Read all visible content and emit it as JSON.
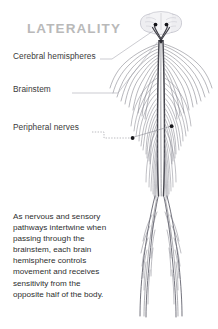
{
  "title": "LATERALITY",
  "colors": {
    "title": "#b9b9b9",
    "label_text": "#3a3a3a",
    "body_text": "#2e2e2e",
    "background": "#ffffff",
    "nerve_line": "#6e6e78",
    "spinal_cord": "#4a4a52",
    "leader_line": "#9a9aa2",
    "marker_dot": "#1a1a1a",
    "brain_fill": "#f2f2f4",
    "brain_outline": "#b4b4bc"
  },
  "callouts": [
    {
      "id": "cerebral-hemispheres",
      "label": "Cerebral hemispheres"
    },
    {
      "id": "brainstem",
      "label": "Brainstem"
    },
    {
      "id": "peripheral-nerves",
      "label": "Peripheral nerves"
    }
  ],
  "description": "As nervous and sensory pathways intertwine when passing through the brainstem, each brain hemisphere controls movement and receives sensitivity from the opposite half of the body.",
  "figure": {
    "name": "human-nervous-system-diagram",
    "parts": [
      "brain",
      "brainstem-decussation",
      "spinal-cord",
      "cervical-nerve-plexus",
      "thoracic-nerve-plexus",
      "lumbar-nerve-plexus",
      "arm-nerves",
      "leg-nerves"
    ]
  }
}
